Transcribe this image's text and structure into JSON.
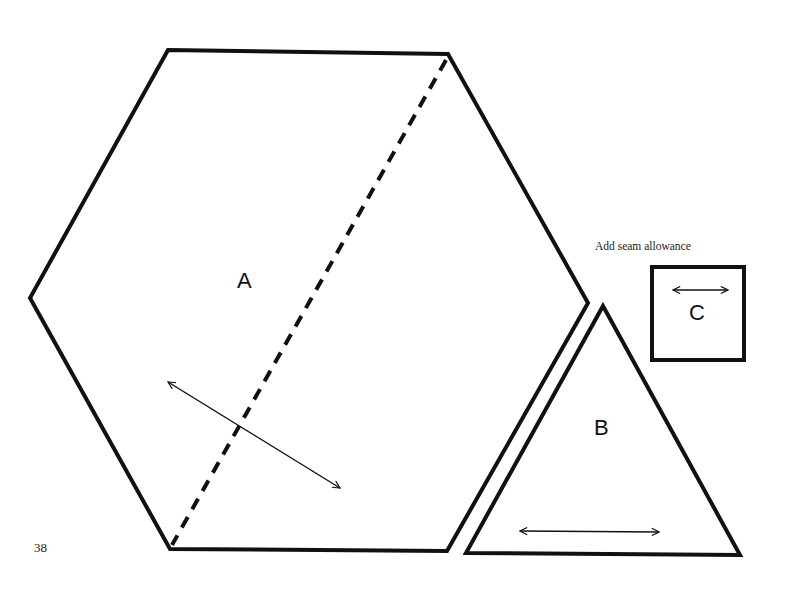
{
  "page": {
    "number": "38",
    "note": "Add seam allowance",
    "ink_color": "#111111",
    "background": "#ffffff"
  },
  "pieces": [
    {
      "id": "A",
      "label": "A",
      "shape": "hexagon",
      "has_cut_line": true,
      "grain_arrow": "diagonal"
    },
    {
      "id": "B",
      "label": "B",
      "shape": "triangle",
      "grain_arrow": "horizontal"
    },
    {
      "id": "C",
      "label": "C",
      "shape": "square",
      "grain_arrow": "horizontal"
    }
  ]
}
